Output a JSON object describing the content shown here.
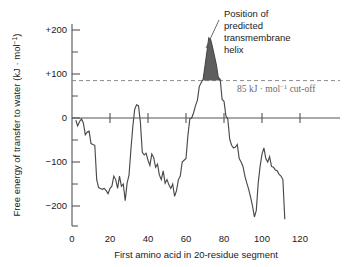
{
  "figure": {
    "background_color": "#ffffff",
    "curve_color": "#4a4a4a",
    "fill_color": "#5e5e5e",
    "cutoff_color": "#8c8c8c"
  },
  "annotations": {
    "peak_label_line1": "Position of",
    "peak_label_line2": "predicted",
    "peak_label_line3": "transmembrane",
    "peak_label_line4": "helix",
    "cutoff_label_value": "85 kJ",
    "cutoff_label_mid": " · mol",
    "cutoff_label_sup": "−1",
    "cutoff_label_tail": " cut-off"
  },
  "axes": {
    "y_title_main": "Free energy of transfer to water (kJ ",
    "y_title_mid": "· mol",
    "y_title_sup": "−1",
    "y_title_tail": ")",
    "x_title": "First amino acid in 20-residue segment",
    "y_ticks": [
      "+200",
      "+100",
      "0",
      "−100",
      "−200"
    ],
    "x_ticks": [
      "0",
      "20",
      "40",
      "60",
      "80",
      "100",
      "120"
    ]
  },
  "chart_data": {
    "type": "line",
    "title": "",
    "xlabel": "First amino acid in 20-residue segment",
    "ylabel": "Free energy of transfer to water (kJ · mol−1)",
    "xlim": [
      0,
      130
    ],
    "ylim": [
      -250,
      220
    ],
    "grid": false,
    "legend": false,
    "y_tick_values": [
      200,
      100,
      0,
      -100,
      -200
    ],
    "y_minor_tick_values": [
      150,
      50,
      -50,
      -150
    ],
    "x_tick_values": [
      0,
      20,
      40,
      60,
      80,
      100,
      120
    ],
    "cutoff": {
      "value": 85,
      "label": "85 kJ · mol−1 cut-off",
      "style": "dashed"
    },
    "shaded_region": {
      "label": "Position of predicted transmembrane helix",
      "x_start": 66,
      "x_end": 77,
      "baseline": 85,
      "peak_x": 69,
      "peak_y": 185
    },
    "series": [
      {
        "name": "hydropathy",
        "x": [
          2,
          3,
          4,
          5,
          6,
          7,
          8,
          9,
          10,
          11,
          12,
          13,
          14,
          15,
          16,
          17,
          18,
          19,
          20,
          21,
          22,
          23,
          24,
          25,
          26,
          27,
          28,
          29,
          30,
          31,
          32,
          33,
          34,
          35,
          36,
          37,
          38,
          39,
          40,
          41,
          42,
          43,
          44,
          45,
          46,
          47,
          48,
          49,
          50,
          51,
          52,
          53,
          54,
          55,
          56,
          57,
          58,
          59,
          60,
          61,
          62,
          63,
          64,
          65,
          66,
          67,
          68,
          69,
          70,
          71,
          72,
          73,
          74,
          75,
          76,
          77,
          78,
          79,
          80,
          81,
          82,
          83,
          84,
          85,
          86,
          87,
          88,
          89,
          90,
          91,
          92,
          93,
          94,
          95,
          96,
          97,
          98,
          99,
          100,
          101,
          102,
          103,
          104,
          105,
          106,
          107,
          108,
          109,
          110,
          111,
          112
        ],
        "y": [
          -5,
          -18,
          -8,
          -2,
          -12,
          -38,
          -32,
          -30,
          -58,
          -60,
          -62,
          -140,
          -158,
          -160,
          -162,
          -160,
          -165,
          -172,
          -160,
          -155,
          -132,
          -140,
          -160,
          -132,
          -155,
          -150,
          -188,
          -148,
          -130,
          -72,
          -20,
          20,
          30,
          28,
          -10,
          -78,
          -84,
          -80,
          -96,
          -108,
          -82,
          -90,
          -112,
          -105,
          -130,
          -140,
          -120,
          -148,
          -140,
          -152,
          -160,
          -150,
          -178,
          -165,
          -140,
          -132,
          -100,
          -96,
          -92,
          -40,
          -2,
          0,
          12,
          28,
          40,
          72,
          80,
          88,
          118,
          150,
          182,
          178,
          160,
          140,
          120,
          92,
          88,
          42,
          38,
          5,
          -2,
          -48,
          -62,
          -68,
          -66,
          -60,
          -92,
          -100,
          -110,
          -132,
          -148,
          -162,
          -180,
          -200,
          -225,
          -210,
          -148,
          -110,
          -82,
          -68,
          -92,
          -100,
          -88,
          -110,
          -112,
          -118,
          -120,
          -128,
          -132,
          -140,
          -230
        ]
      }
    ]
  }
}
